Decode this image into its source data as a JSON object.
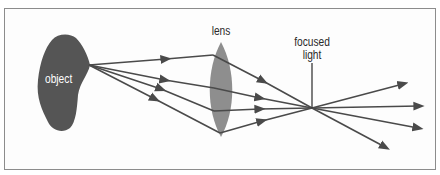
{
  "diagram": {
    "labels": {
      "object": "object",
      "lens": "lens",
      "focused_line1": "focused",
      "focused_line2": "light"
    },
    "colors": {
      "object_fill": "#555555",
      "lens_fill": "#8e8e8e",
      "ray": "#4a4a4a",
      "border": "#8c8c8c"
    },
    "source_point": [
      89,
      65
    ],
    "focal_point": [
      312,
      108
    ],
    "rays": [
      {
        "lens_hit": [
          213,
          55
        ],
        "exit_tip": [
          403,
          84
        ]
      },
      {
        "lens_hit": [
          214,
          88
        ],
        "exit_tip": [
          419,
          106
        ]
      },
      {
        "lens_hit": [
          214,
          111
        ],
        "exit_tip": [
          418,
          128
        ]
      },
      {
        "lens_hit": [
          220,
          133
        ],
        "exit_tip": [
          385,
          147
        ]
      }
    ]
  }
}
